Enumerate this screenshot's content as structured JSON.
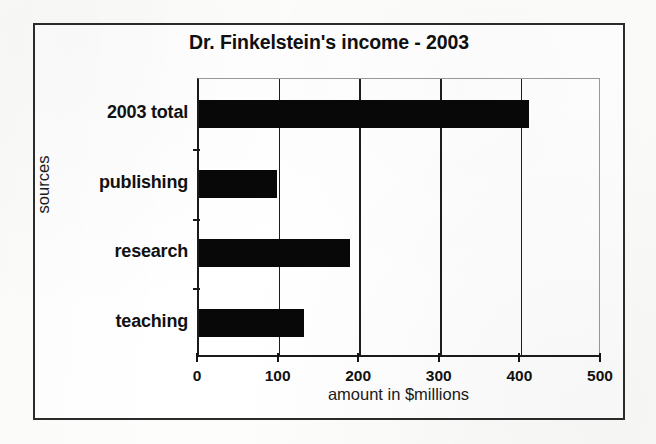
{
  "figure": {
    "background_color": "#ffffff",
    "frame_color": "#2b2b2b",
    "bar_color": "#080808",
    "grid_color": "#1d1d1d"
  },
  "chart_data": {
    "type": "bar",
    "orientation": "horizontal",
    "title": "Dr. Finkelstein's income - 2003",
    "xlabel": "amount in $millions",
    "ylabel": "sources",
    "categories": [
      "teaching",
      "research",
      "publishing",
      "2003 total"
    ],
    "values": [
      130,
      187,
      97,
      410
    ],
    "series": [
      {
        "name": "amount in $millions",
        "values": [
          130,
          187,
          97,
          410
        ]
      }
    ],
    "xlim": [
      0,
      500
    ],
    "xticks": [
      0,
      100,
      200,
      300,
      400,
      500
    ],
    "xtick_labels": [
      "0",
      "100",
      "200",
      "300",
      "400",
      "500"
    ],
    "grid": true,
    "grid_axis": "x",
    "legend": false,
    "legend_position": "none",
    "annotations": []
  }
}
